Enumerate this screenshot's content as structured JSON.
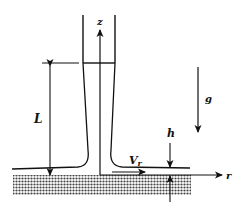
{
  "diagram": {
    "labels": {
      "z_axis": "z",
      "r_axis": "r",
      "length": "L",
      "velocity": "V",
      "velocity_sub": "r",
      "film_thickness": "h",
      "gravity": "g"
    },
    "colors": {
      "ink": "#111111",
      "background": "#ffffff",
      "hatch": "#555555"
    }
  }
}
